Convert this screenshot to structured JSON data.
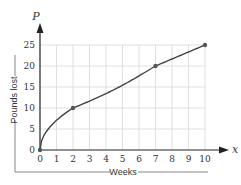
{
  "chart_data": {
    "type": "line",
    "title": "",
    "xlabel": "Weeks",
    "ylabel": "Pounds lost",
    "x_axis_variable": "x",
    "y_axis_variable": "P",
    "xlim": [
      0,
      10
    ],
    "ylim": [
      0,
      25
    ],
    "x_ticks": [
      0,
      1,
      2,
      3,
      4,
      5,
      6,
      7,
      8,
      9,
      10
    ],
    "y_ticks": [
      0,
      5,
      10,
      15,
      20,
      25
    ],
    "grid": true,
    "legend": null,
    "series": [
      {
        "name": "Pounds lost",
        "marked_points": [
          [
            0,
            0
          ],
          [
            2,
            10
          ],
          [
            7,
            20
          ],
          [
            10,
            25
          ]
        ],
        "x": [
          0,
          0.25,
          0.5,
          1,
          1.5,
          2,
          3,
          4,
          5,
          6,
          7,
          8,
          9,
          10
        ],
        "y": [
          0,
          3.9,
          5.6,
          7.9,
          9.7,
          10,
          12.5,
          14.5,
          16.4,
          18.2,
          20,
          21.3,
          23.2,
          25
        ]
      }
    ]
  }
}
